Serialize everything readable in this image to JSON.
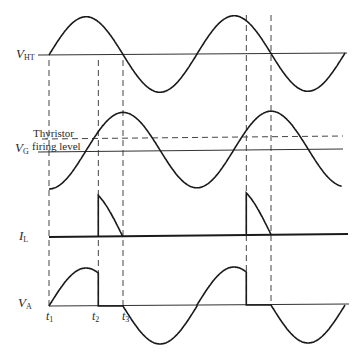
{
  "diagram": {
    "traces": [
      {
        "id": "vht",
        "label_main": "V",
        "label_sub": "HT",
        "description": "Supply voltage (sinusoid)"
      },
      {
        "id": "vg",
        "label_main": "V",
        "label_sub": "G",
        "description": "Gate voltage (sinusoid lagging supply by 90°)"
      },
      {
        "id": "il",
        "label_main": "I",
        "label_sub": "L",
        "description": "Load current pulses between t2 and t3"
      },
      {
        "id": "va",
        "label_main": "V",
        "label_sub": "A",
        "description": "Anode voltage"
      }
    ],
    "firing_level_label_line1": "Thyristor",
    "firing_level_label_line2": "firing level",
    "time_markers": [
      {
        "main": "t",
        "sub": "1"
      },
      {
        "main": "t",
        "sub": "2"
      },
      {
        "main": "t",
        "sub": "3"
      }
    ],
    "cycles_shown": 2,
    "gate_phase_lag_deg": 90,
    "firing_phase_deg": 120
  }
}
